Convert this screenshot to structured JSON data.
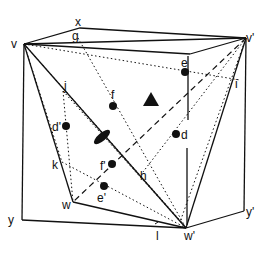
{
  "diagram": {
    "vertex_labels": {
      "v": "v",
      "v_prime": "v'",
      "w": "w",
      "w_prime": "w'",
      "x": "x",
      "y": "y",
      "y_prime": "y'"
    },
    "edge_point_labels": {
      "g": "g",
      "i": "i",
      "j": "j",
      "k": "k",
      "h": "h",
      "l": "l"
    },
    "interior_point_labels": {
      "e": "e",
      "e_prime": "e'",
      "f": "f",
      "f_prime": "f'",
      "d": "d",
      "d_prime": "d'"
    },
    "symbols": [
      "triangle-3fold-axis",
      "ellipse-2fold-axis"
    ],
    "colors": {
      "line": "#111111",
      "background": "#ffffff"
    }
  }
}
